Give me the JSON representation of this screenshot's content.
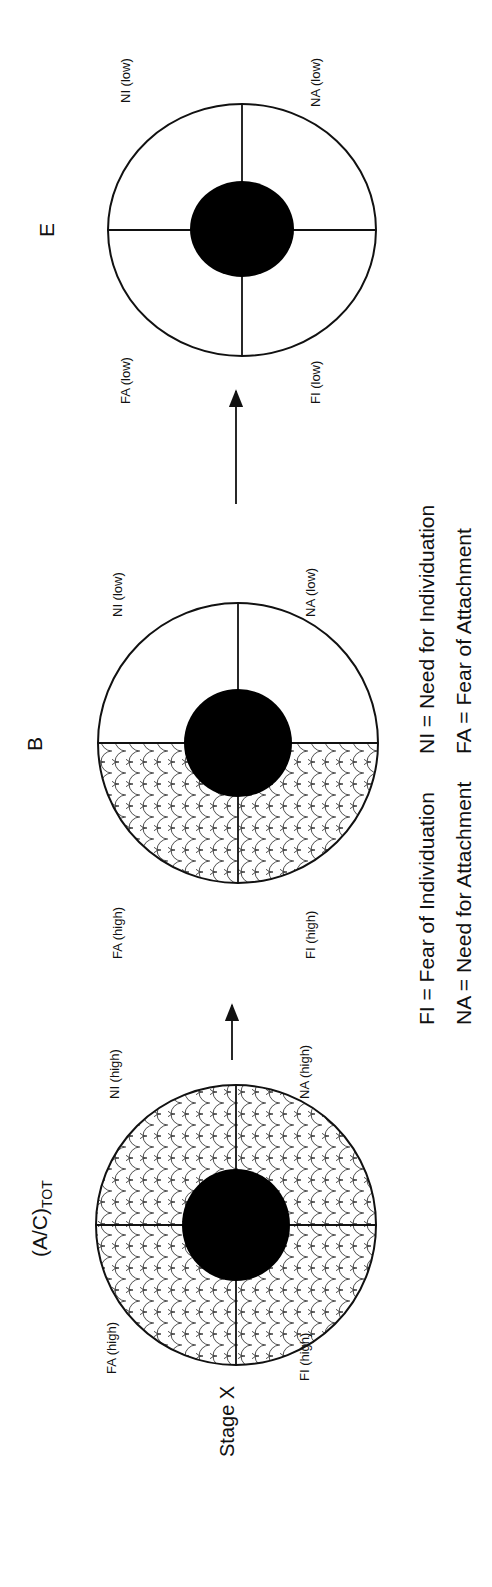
{
  "diagram": {
    "stages": [
      {
        "id": "stage-x",
        "title": "(A/C)",
        "title_subscript": "TOT",
        "side_label": "Stage X",
        "quadrants": {
          "top_left": "FA (high)",
          "top_right": "NI (high)",
          "bottom_left": "FI (high)",
          "bottom_right": "NA (high)"
        },
        "hatched_quadrants": [
          "top_left",
          "top_right",
          "bottom_left",
          "bottom_right"
        ]
      },
      {
        "id": "stage-b",
        "title": "B",
        "quadrants": {
          "top_left": "FA (high)",
          "top_right": "NI (low)",
          "bottom_left": "FI (high)",
          "bottom_right": "NA (low)"
        },
        "hatched_quadrants": [
          "top_left",
          "bottom_left"
        ]
      },
      {
        "id": "stage-e",
        "title": "E",
        "quadrants": {
          "top_left": "FA (low)",
          "top_right": "NI (low)",
          "bottom_left": "FI (low)",
          "bottom_right": "NA (low)"
        },
        "hatched_quadrants": []
      }
    ],
    "legend": {
      "fi": "FI = Fear of Individuation",
      "ni": "NI = Need for Individuation",
      "na": "NA = Need for Attachment",
      "fa": "FA = Fear of Attachment"
    },
    "colors": {
      "line": "#111111",
      "core_fill": "#000000",
      "background": "#ffffff"
    }
  }
}
